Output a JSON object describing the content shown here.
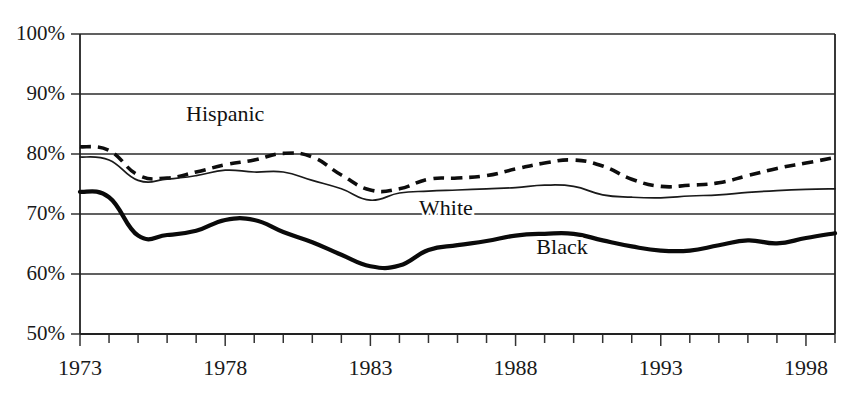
{
  "chart_data": {
    "type": "line",
    "title": "",
    "subtitle": "",
    "xlabel": "",
    "ylabel": "",
    "xlim": [
      1973,
      1999
    ],
    "ylim": [
      50,
      100
    ],
    "y_tick_labels": [
      "100%",
      "90%",
      "80%",
      "70%",
      "60%",
      "50%"
    ],
    "y_tick_values": [
      100,
      90,
      80,
      70,
      60,
      50
    ],
    "x_tick_labels": [
      "1973",
      "1978",
      "1983",
      "1988",
      "1993",
      "1998"
    ],
    "x_tick_values": [
      1973,
      1978,
      1983,
      1988,
      1993,
      1998
    ],
    "x": [
      1973,
      1974,
      1975,
      1976,
      1977,
      1978,
      1979,
      1980,
      1981,
      1982,
      1983,
      1984,
      1985,
      1986,
      1987,
      1988,
      1989,
      1990,
      1991,
      1992,
      1993,
      1994,
      1995,
      1996,
      1997,
      1998,
      1999
    ],
    "grid": "horizontal",
    "legend_position": "inline-annotations",
    "series": [
      {
        "name": "Hispanic",
        "style": "dashed",
        "color": "#0d0d0d",
        "label_x": 1978,
        "label_y": 85.5,
        "values": [
          81.2,
          80.6,
          76.5,
          76.0,
          77.0,
          78.2,
          79.0,
          80.1,
          79.5,
          76.5,
          74.0,
          74.2,
          75.8,
          76.0,
          76.4,
          77.5,
          78.5,
          79.0,
          78.0,
          75.8,
          74.6,
          74.8,
          75.2,
          76.4,
          77.6,
          78.5,
          79.4
        ]
      },
      {
        "name": "White",
        "style": "solid-thin",
        "color": "#1a1a1a",
        "label_x": 1985.6,
        "label_y": 69.8,
        "values": [
          79.5,
          79.0,
          75.6,
          75.8,
          76.4,
          77.3,
          77.0,
          77.0,
          75.6,
          74.2,
          72.3,
          73.5,
          73.8,
          74.0,
          74.2,
          74.4,
          74.8,
          74.6,
          73.2,
          72.8,
          72.7,
          73.0,
          73.2,
          73.6,
          73.9,
          74.1,
          74.2
        ]
      },
      {
        "name": "Black",
        "style": "solid-thick",
        "color": "#0a0a0a",
        "label_x": 1989.6,
        "label_y": 63.4,
        "values": [
          73.7,
          72.8,
          66.4,
          66.5,
          67.2,
          69.0,
          69.0,
          67.0,
          65.3,
          63.2,
          61.3,
          61.4,
          64.0,
          64.8,
          65.5,
          66.4,
          66.7,
          66.7,
          65.6,
          64.6,
          63.9,
          63.9,
          64.8,
          65.6,
          65.1,
          66.0,
          66.8
        ]
      }
    ]
  },
  "annotations": {
    "hispanic_label": "Hispanic",
    "white_label": "White",
    "black_label": "Black"
  }
}
